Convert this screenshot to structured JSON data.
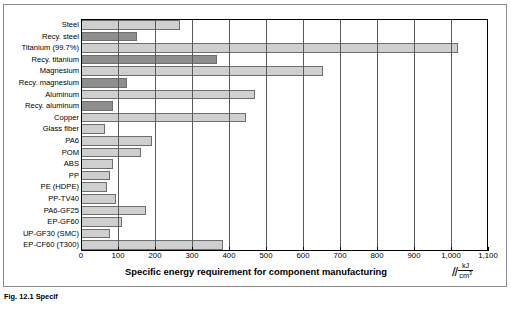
{
  "chart_data": {
    "type": "bar",
    "orientation": "horizontal",
    "title": "",
    "xlabel": "Specific energy requirement for component manufacturing",
    "xunit_numerator": "kJ",
    "xunit_denominator": "cm",
    "xunit_denominator_exp": "3",
    "ylabel": "",
    "xlim": [
      0,
      1100
    ],
    "xticks": [
      0,
      100,
      200,
      300,
      400,
      500,
      600,
      700,
      800,
      900,
      1000,
      1100
    ],
    "xticklabels": [
      "0",
      "100",
      "200",
      "300",
      "400",
      "500",
      "600",
      "700",
      "800",
      "900",
      "1,000",
      "1,100"
    ],
    "grid": "vertical",
    "legend": "none",
    "categories": [
      "Steel",
      "Recy. steel",
      "Titanium (99.7%)",
      "Recy. titanium",
      "Magnesium",
      "Recy. magnesium",
      "Aluminum",
      "Recy. aluminum",
      "Copper",
      "Glass fiber",
      "PA6",
      "POM",
      "ABS",
      "PP",
      "PE (HDPE)",
      "PP-TV40",
      "PA6-GF25",
      "EP-GF60",
      "UP-GF30 (SMC)",
      "EP-CF60 (T300)"
    ],
    "values": [
      268,
      150,
      1020,
      368,
      654,
      124,
      470,
      87,
      446,
      65,
      192,
      162,
      86,
      78,
      70,
      95,
      175,
      110,
      78,
      385
    ],
    "bar_shades": [
      "light",
      "dark",
      "light",
      "dark",
      "light",
      "dark",
      "light",
      "dark",
      "light",
      "light",
      "light",
      "light",
      "light",
      "light",
      "light",
      "light",
      "light",
      "light",
      "light",
      "light"
    ],
    "colors": {
      "light_bar": "#cfcfcf",
      "dark_bar": "#8e8e8e",
      "bar_border": "#6e6e6e",
      "gridline": "#5a5a5a",
      "axis": "#000000",
      "background": "#ffffff"
    }
  },
  "caption": "Fig. 12.1  Specif"
}
